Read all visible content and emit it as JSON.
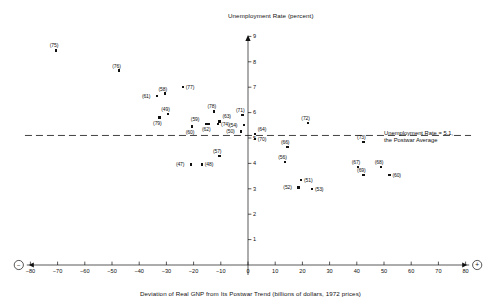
{
  "chart_data": {
    "type": "scatter",
    "title": "",
    "ylabel": "Unemployment Rate (percent)",
    "xlabel": "Deviation of Real GNP from Its Postwar Trend (billions of dollars, 1972 prices)",
    "xlim": [
      -85,
      85
    ],
    "ylim": [
      0,
      9.3
    ],
    "xticks": [
      -80,
      -70,
      -60,
      -50,
      -40,
      -30,
      -20,
      -10,
      0,
      10,
      20,
      30,
      40,
      50,
      60,
      70,
      80
    ],
    "yticks": [
      1,
      2,
      3,
      4,
      5,
      6,
      7,
      8,
      9
    ],
    "grid": false,
    "legend": "none",
    "x_axis_end_left_symbol": "−",
    "x_axis_end_right_symbol": "+",
    "reference_line": {
      "y": 5.1,
      "style": "dashed",
      "label_line1": "Unemployment Rate = 5.1,",
      "label_line2": "the Postwar Average"
    },
    "points": [
      {
        "label": "(75)",
        "x": -70.5,
        "y": 8.45
      },
      {
        "label": "(76)",
        "x": -47.5,
        "y": 7.65
      },
      {
        "label": "(58)",
        "x": -30.5,
        "y": 6.75
      },
      {
        "label": "(77)",
        "x": -24.0,
        "y": 7.0
      },
      {
        "label": "(61)",
        "x": -33.5,
        "y": 6.65
      },
      {
        "label": "(49)",
        "x": -29.5,
        "y": 5.95
      },
      {
        "label": "(79)",
        "x": -32.5,
        "y": 5.8
      },
      {
        "label": "(78)",
        "x": -12.5,
        "y": 6.05
      },
      {
        "label": "(59)",
        "x": -15.5,
        "y": 5.55
      },
      {
        "label": "(63)",
        "x": -10.5,
        "y": 5.65
      },
      {
        "label": "(74)",
        "x": -11.0,
        "y": 5.55
      },
      {
        "label": "(62)",
        "x": -14.5,
        "y": 5.55
      },
      {
        "label": "(60)",
        "x": -20.5,
        "y": 5.45
      },
      {
        "label": "(71)",
        "x": -2.0,
        "y": 5.9
      },
      {
        "label": "(54)",
        "x": -1.5,
        "y": 5.5
      },
      {
        "label": "(50)",
        "x": -2.5,
        "y": 5.25
      },
      {
        "label": "(64)",
        "x": 2.5,
        "y": 5.15
      },
      {
        "label": "(70)",
        "x": 2.5,
        "y": 4.95
      },
      {
        "label": "(72)",
        "x": 22.0,
        "y": 5.6
      },
      {
        "label": "(66)",
        "x": 14.5,
        "y": 4.65
      },
      {
        "label": "(73)",
        "x": 42.5,
        "y": 4.85
      },
      {
        "label": "(57)",
        "x": -10.5,
        "y": 4.3
      },
      {
        "label": "(47)",
        "x": -21.0,
        "y": 3.95
      },
      {
        "label": "(48)",
        "x": -17.0,
        "y": 3.95
      },
      {
        "label": "(56)",
        "x": 13.5,
        "y": 4.05
      },
      {
        "label": "(51)",
        "x": 19.5,
        "y": 3.35
      },
      {
        "label": "(52)",
        "x": 18.5,
        "y": 3.05
      },
      {
        "label": "(53)",
        "x": 23.5,
        "y": 3.0
      },
      {
        "label": "(67)",
        "x": 40.5,
        "y": 3.85
      },
      {
        "label": "(68)",
        "x": 49.0,
        "y": 3.85
      },
      {
        "label": "(69)",
        "x": 42.5,
        "y": 3.55
      },
      {
        "label": "(60b)",
        "x": 52.0,
        "y": 3.55
      }
    ],
    "point_label_overrides": {
      "(60b)": "(60)"
    }
  }
}
